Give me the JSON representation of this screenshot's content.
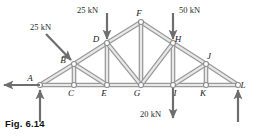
{
  "figure": {
    "caption": "Fig. 6.14",
    "type": "truss-free-body-diagram",
    "colors": {
      "member": "#b9b9b9",
      "member_edge": "#9a9a9a",
      "node_stroke": "#8c8c8c",
      "node_fill": "#ffffff",
      "arrow": "#6e6e6e",
      "text": "#1a1a1a"
    }
  },
  "nodes": [
    {
      "id": "A",
      "label": "A",
      "x": 40,
      "y": 85,
      "label_dx": -10,
      "label_dy": -4
    },
    {
      "id": "B",
      "label": "B",
      "x": 74,
      "y": 64,
      "label_dx": -11,
      "label_dy": -1
    },
    {
      "id": "C",
      "label": "C",
      "x": 74,
      "y": 85,
      "label_dx": -3,
      "label_dy": 11
    },
    {
      "id": "D",
      "label": "D",
      "x": 107,
      "y": 43,
      "label_dx": -11,
      "label_dy": -1
    },
    {
      "id": "E",
      "label": "E",
      "x": 107,
      "y": 85,
      "label_dx": -3,
      "label_dy": 11
    },
    {
      "id": "F",
      "label": "F",
      "x": 141,
      "y": 22,
      "label_dx": -2,
      "label_dy": -6
    },
    {
      "id": "G",
      "label": "G",
      "x": 141,
      "y": 85,
      "label_dx": -4,
      "label_dy": 11
    },
    {
      "id": "H",
      "label": "H",
      "x": 173,
      "y": 43,
      "label_dx": 5,
      "label_dy": -1
    },
    {
      "id": "I",
      "label": "I",
      "x": 173,
      "y": 85,
      "label_dx": 2,
      "label_dy": 11
    },
    {
      "id": "J",
      "label": "J",
      "x": 206,
      "y": 64,
      "label_dx": 3,
      "label_dy": -5
    },
    {
      "id": "K",
      "label": "K",
      "x": 206,
      "y": 85,
      "label_dx": -3,
      "label_dy": 11
    },
    {
      "id": "L",
      "label": "L",
      "x": 238,
      "y": 85,
      "label_dx": 5,
      "label_dy": 3
    }
  ],
  "members": [
    {
      "from": "A",
      "to": "B"
    },
    {
      "from": "B",
      "to": "D"
    },
    {
      "from": "D",
      "to": "F"
    },
    {
      "from": "F",
      "to": "H"
    },
    {
      "from": "H",
      "to": "J"
    },
    {
      "from": "J",
      "to": "L"
    },
    {
      "from": "A",
      "to": "C"
    },
    {
      "from": "C",
      "to": "E"
    },
    {
      "from": "E",
      "to": "G"
    },
    {
      "from": "G",
      "to": "I"
    },
    {
      "from": "I",
      "to": "K"
    },
    {
      "from": "K",
      "to": "L"
    },
    {
      "from": "B",
      "to": "C"
    },
    {
      "from": "D",
      "to": "E"
    },
    {
      "from": "F",
      "to": "G"
    },
    {
      "from": "H",
      "to": "I"
    },
    {
      "from": "J",
      "to": "K"
    },
    {
      "from": "B",
      "to": "E"
    },
    {
      "from": "D",
      "to": "G"
    },
    {
      "from": "H",
      "to": "G"
    },
    {
      "from": "J",
      "to": "I"
    }
  ],
  "loads": [
    {
      "id": "load-b",
      "label": "25 kN",
      "magnitude": 25,
      "unit": "kN",
      "at_node": "B",
      "direction": "inclined-down-right",
      "tail_x": 46,
      "tail_y": 34,
      "head_x": 71,
      "head_y": 60,
      "label_x": 30,
      "label_y": 30
    },
    {
      "id": "load-d",
      "label": "25 kN",
      "magnitude": 25,
      "unit": "kN",
      "at_node": "D",
      "direction": "down",
      "tail_x": 107,
      "tail_y": 13,
      "head_x": 107,
      "head_y": 39,
      "label_x": 77,
      "label_y": 13
    },
    {
      "id": "load-h",
      "label": "50 kN",
      "magnitude": 50,
      "unit": "kN",
      "at_node": "H",
      "direction": "down",
      "tail_x": 173,
      "tail_y": 13,
      "head_x": 173,
      "head_y": 39,
      "label_x": 179,
      "label_y": 13
    },
    {
      "id": "load-i",
      "label": "20 kN",
      "magnitude": 20,
      "unit": "kN",
      "at_node": "I",
      "direction": "down",
      "tail_x": 173,
      "tail_y": 88,
      "head_x": 173,
      "head_y": 118,
      "label_x": 140,
      "label_y": 117
    }
  ],
  "reactions": [
    {
      "id": "reaction-a-horizontal",
      "at_node": "A",
      "direction": "left",
      "tail_x": 40,
      "tail_y": 85,
      "head_x": 4,
      "head_y": 85
    },
    {
      "id": "reaction-a-vertical",
      "at_node": "A",
      "direction": "up",
      "tail_x": 40,
      "tail_y": 122,
      "head_x": 40,
      "head_y": 90
    },
    {
      "id": "reaction-l-vertical",
      "at_node": "L",
      "direction": "up",
      "tail_x": 238,
      "tail_y": 122,
      "head_x": 238,
      "head_y": 90
    }
  ]
}
